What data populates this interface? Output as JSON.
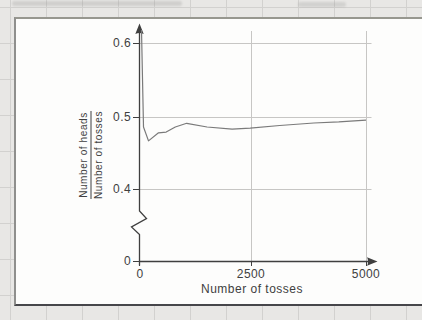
{
  "figure": {
    "y_axis": {
      "label_numerator": "Number of heads",
      "label_denominator": "Number of tosses",
      "ticks": [
        "0.6",
        "0.5",
        "0.4",
        "0"
      ]
    },
    "x_axis": {
      "label": "Number of tosses",
      "ticks": [
        "0",
        "2500",
        "5000"
      ]
    }
  },
  "colors": {
    "paper": "#e8e7e5",
    "paper_grid_line": "#d2d1cf",
    "panel_background": "#fdfdfc",
    "axis": "#3f3f3f",
    "chart_grid_line": "#c7c6c4",
    "curve": "#7a7a7a",
    "text": "#3f3f3f"
  },
  "chart_data": {
    "type": "line",
    "title": "",
    "xlabel": "Number of tosses",
    "ylabel": "Number of heads / Number of tosses",
    "x_ticks": [
      0,
      2500,
      5000
    ],
    "y_ticks": [
      0,
      0.4,
      0.5,
      0.6
    ],
    "y_axis_break_between": [
      0,
      0.4
    ],
    "xlim": [
      0,
      5200
    ],
    "ylim_shown": [
      0.4,
      0.62
    ],
    "grid": true,
    "reference_value": 0.5,
    "series": [
      {
        "name": "relative frequency of heads",
        "points": [
          [
            55,
            0.62
          ],
          [
            100,
            0.487
          ],
          [
            210,
            0.468
          ],
          [
            430,
            0.479
          ],
          [
            600,
            0.48
          ],
          [
            800,
            0.487
          ],
          [
            1050,
            0.492
          ],
          [
            1500,
            0.487
          ],
          [
            2050,
            0.484
          ],
          [
            2450,
            0.4855
          ],
          [
            3100,
            0.489
          ],
          [
            3850,
            0.4925
          ],
          [
            4400,
            0.494
          ],
          [
            5000,
            0.4965
          ]
        ]
      }
    ]
  }
}
